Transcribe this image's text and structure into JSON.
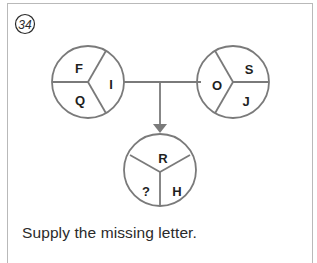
{
  "puzzle": {
    "number": "34",
    "instruction": "Supply the missing letter.",
    "colors": {
      "line": "#7a7a7a",
      "text": "#1f1f1f",
      "frame": "#b9b9b9"
    },
    "circles": {
      "left": {
        "segments": {
          "top_left": "F",
          "right": "I",
          "bottom_left": "Q"
        }
      },
      "right": {
        "segments": {
          "left": "O",
          "top_right": "S",
          "bottom_right": "J"
        }
      },
      "bottom": {
        "segments": {
          "top": "R",
          "bottom_left": "?",
          "bottom_right": "H"
        }
      }
    }
  }
}
